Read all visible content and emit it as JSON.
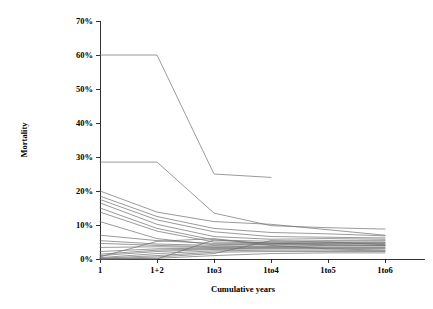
{
  "chart_data": {
    "type": "line",
    "title": "",
    "xlabel": "Cumulative years",
    "ylabel": "Mortality",
    "categories": [
      "1",
      "1+2",
      "1to3",
      "1to4",
      "1to5",
      "1to6"
    ],
    "ylim": [
      0,
      70
    ],
    "ytick_labels": [
      "0%",
      "10%",
      "20%",
      "30%",
      "40%",
      "50%",
      "60%",
      "70%"
    ],
    "ytick_values": [
      0,
      10,
      20,
      30,
      40,
      50,
      60,
      70
    ],
    "grid": false,
    "legend": "none",
    "y_units": "percent",
    "line_color": "#6e6e6e",
    "series": [
      {
        "name": "series-1",
        "values": [
          60.0,
          60.0,
          25.0,
          24.0,
          null,
          null
        ]
      },
      {
        "name": "series-2",
        "values": [
          28.5,
          28.5,
          13.5,
          9.8,
          9.2,
          8.8
        ]
      },
      {
        "name": "series-3",
        "values": [
          20.0,
          13.8,
          11.0,
          10.2,
          8.6,
          7.0
        ]
      },
      {
        "name": "series-4",
        "values": [
          18.5,
          12.5,
          9.0,
          7.8,
          7.4,
          6.8
        ]
      },
      {
        "name": "series-5",
        "values": [
          17.5,
          11.5,
          8.0,
          6.6,
          6.4,
          6.2
        ]
      },
      {
        "name": "series-6",
        "values": [
          16.5,
          10.2,
          6.6,
          5.8,
          6.0,
          5.8
        ]
      },
      {
        "name": "series-7",
        "values": [
          15.0,
          9.0,
          5.6,
          5.2,
          5.4,
          5.4
        ]
      },
      {
        "name": "series-8",
        "values": [
          13.8,
          8.2,
          5.0,
          4.8,
          5.0,
          5.0
        ]
      },
      {
        "name": "series-9",
        "values": [
          11.0,
          6.0,
          4.2,
          4.4,
          4.8,
          4.8
        ]
      },
      {
        "name": "series-10",
        "values": [
          7.0,
          5.4,
          4.6,
          4.6,
          4.6,
          4.6
        ]
      },
      {
        "name": "series-11",
        "values": [
          5.4,
          4.4,
          4.0,
          4.2,
          4.4,
          4.4
        ]
      },
      {
        "name": "series-12",
        "values": [
          4.6,
          4.0,
          3.6,
          3.8,
          4.0,
          4.0
        ]
      },
      {
        "name": "series-13",
        "values": [
          3.4,
          3.6,
          3.4,
          3.6,
          3.8,
          3.8
        ]
      },
      {
        "name": "series-14",
        "values": [
          2.2,
          3.0,
          3.2,
          3.4,
          3.4,
          3.4
        ]
      },
      {
        "name": "series-15",
        "values": [
          1.4,
          2.6,
          3.0,
          3.2,
          3.2,
          3.2
        ]
      },
      {
        "name": "series-16",
        "values": [
          1.0,
          2.2,
          2.8,
          3.0,
          3.0,
          3.0
        ]
      },
      {
        "name": "series-17",
        "values": [
          0.6,
          5.2,
          6.0,
          4.0,
          3.0,
          2.6
        ]
      },
      {
        "name": "series-18",
        "values": [
          0.4,
          1.6,
          2.4,
          2.6,
          2.6,
          2.4
        ]
      },
      {
        "name": "series-19",
        "values": [
          0.2,
          1.0,
          2.0,
          2.2,
          2.2,
          2.2
        ]
      },
      {
        "name": "series-20",
        "values": [
          0.0,
          0.6,
          1.6,
          5.4,
          5.0,
          4.2
        ]
      },
      {
        "name": "series-21",
        "values": [
          0.0,
          0.2,
          1.0,
          1.6,
          1.8,
          1.8
        ]
      },
      {
        "name": "series-22",
        "values": [
          0.0,
          0.0,
          5.6,
          4.6,
          4.2,
          4.0
        ]
      }
    ]
  }
}
